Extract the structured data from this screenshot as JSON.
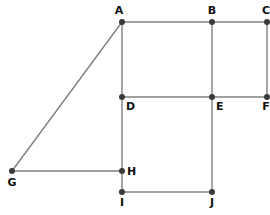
{
  "diagram": {
    "type": "graph",
    "colors": {
      "edge": "#808080",
      "node": "#3a3a3a",
      "label": "#111111",
      "background": "#ffffff"
    },
    "nodes": [
      {
        "id": "A",
        "label": "A",
        "x": 122,
        "y": 22,
        "lx": 119,
        "ly": 14,
        "anchor": "middle"
      },
      {
        "id": "B",
        "label": "B",
        "x": 212,
        "y": 22,
        "lx": 212,
        "ly": 14,
        "anchor": "middle"
      },
      {
        "id": "C",
        "label": "C",
        "x": 267,
        "y": 22,
        "lx": 266,
        "ly": 14,
        "anchor": "middle"
      },
      {
        "id": "D",
        "label": "D",
        "x": 122,
        "y": 97,
        "lx": 126,
        "ly": 110,
        "anchor": "start"
      },
      {
        "id": "E",
        "label": "E",
        "x": 212,
        "y": 97,
        "lx": 216,
        "ly": 110,
        "anchor": "start"
      },
      {
        "id": "F",
        "label": "F",
        "x": 267,
        "y": 97,
        "lx": 266,
        "ly": 110,
        "anchor": "middle"
      },
      {
        "id": "G",
        "label": "G",
        "x": 12,
        "y": 171,
        "lx": 12,
        "ly": 186,
        "anchor": "middle"
      },
      {
        "id": "H",
        "label": "H",
        "x": 122,
        "y": 171,
        "lx": 127,
        "ly": 175,
        "anchor": "start"
      },
      {
        "id": "I",
        "label": "I",
        "x": 122,
        "y": 192,
        "lx": 122,
        "ly": 206,
        "anchor": "middle"
      },
      {
        "id": "J",
        "label": "J",
        "x": 212,
        "y": 192,
        "lx": 212,
        "ly": 206,
        "anchor": "middle"
      }
    ],
    "edges": [
      [
        "A",
        "B"
      ],
      [
        "B",
        "C"
      ],
      [
        "A",
        "D"
      ],
      [
        "B",
        "E"
      ],
      [
        "C",
        "F"
      ],
      [
        "D",
        "E"
      ],
      [
        "E",
        "F"
      ],
      [
        "A",
        "G"
      ],
      [
        "G",
        "H"
      ],
      [
        "D",
        "H"
      ],
      [
        "H",
        "I"
      ],
      [
        "I",
        "J"
      ],
      [
        "E",
        "J"
      ]
    ]
  }
}
